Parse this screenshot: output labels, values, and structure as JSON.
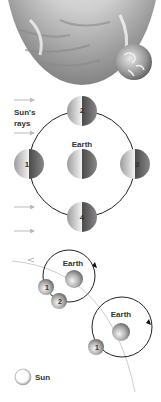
{
  "top": {
    "sun_surface": "sun-surface-image",
    "earth_globe": "earth-globe-image"
  },
  "orbit_diagram": {
    "rays_label_line1": "Sun's",
    "rays_label_line2": "rays",
    "center_label": "Earth",
    "moons": [
      {
        "label": "1",
        "position": "left"
      },
      {
        "label": "2",
        "position": "top"
      },
      {
        "label": "3",
        "position": "right"
      },
      {
        "label": "4",
        "position": "bottom"
      }
    ]
  },
  "path_diagram": {
    "earth1_label": "Earth",
    "earth2_label": "Earth",
    "moon_a1": "1",
    "moon_a2": "2",
    "moon_b1": "1"
  },
  "legend": {
    "sun_label": "Sun"
  },
  "colors": {
    "line": "#222222",
    "arrow": "#bbbbbb",
    "path": "#cccccc"
  }
}
